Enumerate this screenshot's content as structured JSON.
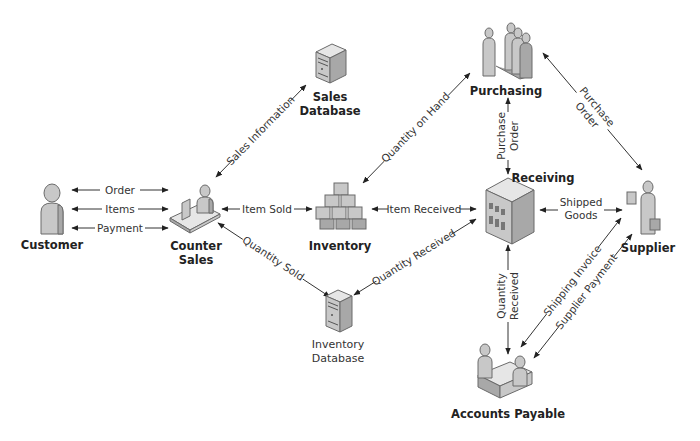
{
  "diagram": {
    "type": "flow",
    "nodes": {
      "customer": {
        "label": "Customer",
        "icon": "person-icon"
      },
      "counter_sales": {
        "label_line1": "Counter",
        "label_line2": "Sales",
        "icon": "person-at-desk-icon"
      },
      "sales_database": {
        "label_line1": "Sales",
        "label_line2": "Database",
        "icon": "server-icon"
      },
      "inventory": {
        "label": "Inventory",
        "icon": "boxes-icon"
      },
      "inventory_database": {
        "label_line1": "Inventory",
        "label_line2": "Database",
        "icon": "server-icon"
      },
      "purchasing": {
        "label": "Purchasing",
        "icon": "group-of-people-icon"
      },
      "receiving": {
        "label": "Receiving",
        "icon": "building-icon"
      },
      "supplier": {
        "label": "Supplier",
        "icon": "person-with-briefcase-icon"
      },
      "accounts_payable": {
        "label": "Accounts Payable",
        "icon": "meeting-icon"
      }
    },
    "edges": {
      "order": {
        "label": "Order",
        "from": "Customer",
        "to": "Counter Sales"
      },
      "items": {
        "label": "Items",
        "from": "Customer",
        "to": "Counter Sales"
      },
      "payment": {
        "label": "Payment",
        "from": "Customer",
        "to": "Counter Sales"
      },
      "sales_information": {
        "label": "Sales Information",
        "from": "Counter Sales",
        "to": "Sales Database"
      },
      "item_sold": {
        "label": "Item Sold",
        "from": "Counter Sales",
        "to": "Inventory"
      },
      "quantity_sold": {
        "label": "Quantity Sold",
        "from": "Counter Sales",
        "to": "Inventory Database"
      },
      "quantity_on_hand": {
        "label": "Quantity on Hand",
        "from": "Inventory",
        "to": "Purchasing"
      },
      "item_received": {
        "label": "Item Received",
        "from": "Inventory",
        "to": "Receiving"
      },
      "quantity_received_db": {
        "label": "Quantity Received",
        "from": "Inventory Database",
        "to": "Receiving"
      },
      "purchase_order_vertical": {
        "label_line1": "Purchase",
        "label_line2": "Order",
        "from": "Purchasing",
        "to": "Receiving"
      },
      "purchase_order_diag": {
        "label_line1": "Purchase",
        "label_line2": "Order",
        "from": "Purchasing",
        "to": "Supplier"
      },
      "shipped_goods": {
        "label_line1": "Shipped",
        "label_line2": "Goods",
        "from": "Receiving",
        "to": "Supplier"
      },
      "quantity_received_ap": {
        "label_line1": "Quantity",
        "label_line2": "Received",
        "from": "Receiving",
        "to": "Accounts Payable"
      },
      "shipping_invoice": {
        "label": "Shipping Invoice",
        "from": "Supplier",
        "to": "Accounts Payable"
      },
      "supplier_payment": {
        "label": "Supplier Payment",
        "from": "Accounts Payable",
        "to": "Supplier"
      }
    }
  }
}
